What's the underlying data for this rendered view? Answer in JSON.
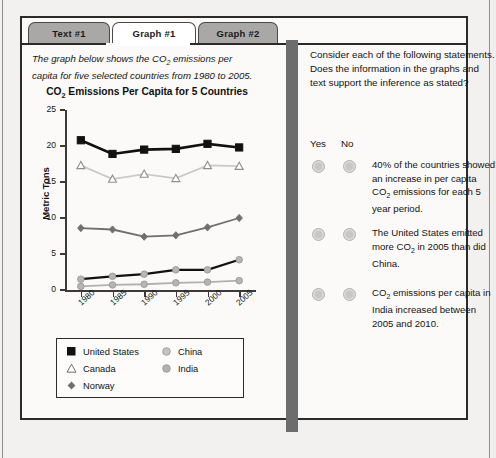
{
  "tabs": [
    {
      "label": "Text #1",
      "active": false
    },
    {
      "label": "Graph #1",
      "active": true
    },
    {
      "label": "Graph #2",
      "active": false
    }
  ],
  "left_panel": {
    "prompt": "The graph below shows the CO₂ emissions per capita for five selected countries from 1980 to 2005."
  },
  "right_panel": {
    "intro": "Consider each of the following statements. Does the information in the graphs and text support the inference as stated?",
    "yes_label": "Yes",
    "no_label": "No",
    "statements": [
      "40% of the countries showed an increase in per capita CO₂ emissions for each 5 year period.",
      "The United States emitted more CO₂ in 2005 than did China.",
      "CO₂ emissions per capita in India increased between 2005 and 2010."
    ]
  },
  "chart_data": {
    "type": "line",
    "xlabel": "",
    "ylabel": "Metric Tons",
    "categories": [
      "1980",
      "1985",
      "1990",
      "1995",
      "2000",
      "2005"
    ],
    "x": [
      1980,
      1985,
      1990,
      1995,
      2000,
      2005
    ],
    "ylim": [
      0,
      25
    ],
    "yticks": [
      0,
      5,
      10,
      15,
      20,
      25
    ],
    "grid": false,
    "legend_position": "bottom",
    "series": [
      {
        "name": "United States",
        "values": [
          20.8,
          18.9,
          19.5,
          19.6,
          20.3,
          19.8
        ],
        "color": "#111111",
        "marker": "square-filled"
      },
      {
        "name": "Canada",
        "values": [
          17.3,
          15.4,
          16.1,
          15.5,
          17.3,
          17.2
        ],
        "color": "#c9c9c9",
        "marker": "triangle-open"
      },
      {
        "name": "Norway",
        "values": [
          8.6,
          8.4,
          7.4,
          7.6,
          8.7,
          10.0
        ],
        "color": "#6f6f6f",
        "marker": "diamond-filled"
      },
      {
        "name": "China",
        "values": [
          1.5,
          1.9,
          2.2,
          2.8,
          2.8,
          4.2
        ],
        "color": "#111111",
        "marker": "circle-gray"
      },
      {
        "name": "India",
        "values": [
          0.5,
          0.7,
          0.8,
          1.0,
          1.1,
          1.3
        ],
        "color": "#b0b0b0",
        "marker": "circle-gray"
      }
    ]
  },
  "colors": {
    "page_bg": "#f2f1ef",
    "divider": "#6d6d6d",
    "tab_inactive": "#a9a8a6",
    "tab_active": "#ffffff",
    "border": "#2b2b2b"
  }
}
